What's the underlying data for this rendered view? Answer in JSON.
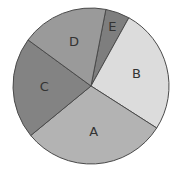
{
  "chart_data": {
    "type": "pie",
    "title": "",
    "categories": [
      "E",
      "B",
      "A",
      "C",
      "D"
    ],
    "values": [
      5,
      26,
      30,
      21,
      18
    ],
    "unit": "percent (estimated)",
    "start_angle_deg": 11,
    "direction": "clockwise",
    "colors": {
      "A": "#b3b3b3",
      "B": "#dcdcdc",
      "C": "#838383",
      "D": "#9a9a9a",
      "E": "#7e7e7e"
    },
    "labels_inside": true,
    "legend": "none"
  },
  "style": {
    "edge_color": "#4a4a4a",
    "label_color": "#333333"
  }
}
